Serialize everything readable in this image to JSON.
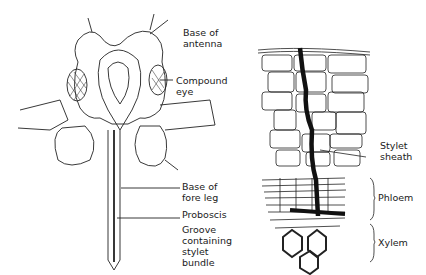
{
  "left_figure": {
    "subject": "aphid head, ventral view",
    "labels": [
      {
        "id": "antenna",
        "text": "Base of\nantenna"
      },
      {
        "id": "eye",
        "text": "Compound\neye"
      },
      {
        "id": "foreleg",
        "text": "Base of\nfore leg"
      },
      {
        "id": "proboscis",
        "text": "Proboscis"
      },
      {
        "id": "groove",
        "text": "Groove\ncontaining\nstylet\nbundle"
      }
    ]
  },
  "right_figure": {
    "subject": "plant tissue section with stylet track",
    "labels": [
      {
        "id": "sheath",
        "text": "Stylet\nsheath"
      },
      {
        "id": "phloem",
        "text": "Phloem"
      },
      {
        "id": "xylem",
        "text": "Xylem"
      }
    ]
  }
}
